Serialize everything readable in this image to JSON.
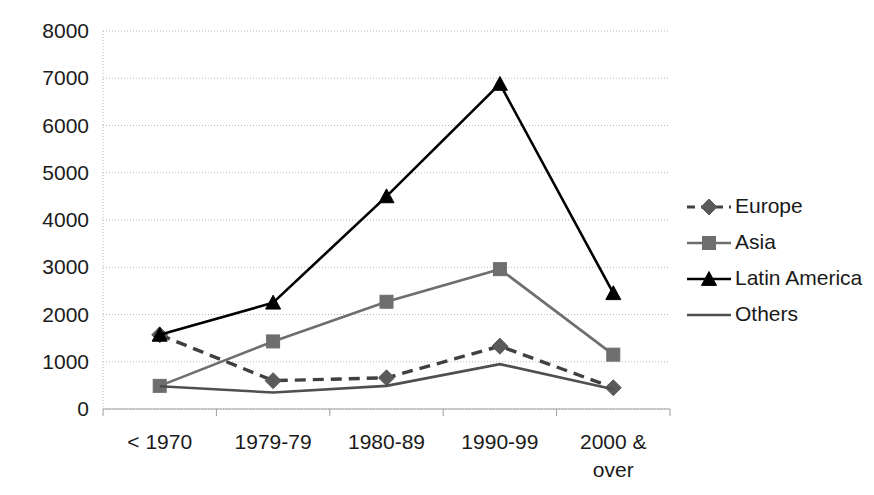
{
  "chart_data": {
    "type": "line",
    "title": "",
    "xlabel": "",
    "ylabel": "",
    "categories": [
      "< 1970",
      "1979-79",
      "1980-89",
      "1990-99",
      "2000 & over"
    ],
    "ylim": [
      0,
      8000
    ],
    "ytick_labels": [
      "0",
      "1000",
      "2000",
      "3000",
      "4000",
      "5000",
      "6000",
      "7000",
      "8000"
    ],
    "ytick_values": [
      0,
      1000,
      2000,
      3000,
      4000,
      5000,
      6000,
      7000,
      8000
    ],
    "grid": true,
    "legend_position": "right",
    "series": [
      {
        "name": "Europe",
        "values": [
          1570,
          600,
          660,
          1330,
          450
        ],
        "color": "#404040",
        "line_style": "dashed",
        "marker": "diamond",
        "marker_color": "#5a5a5a"
      },
      {
        "name": "Asia",
        "values": [
          490,
          1430,
          2270,
          2960,
          1150
        ],
        "color": "#6e6e6e",
        "line_style": "solid",
        "marker": "square",
        "marker_color": "#6e6e6e"
      },
      {
        "name": "Latin America",
        "values": [
          1570,
          2250,
          4500,
          6880,
          2450
        ],
        "color": "#000000",
        "line_style": "solid",
        "marker": "triangle",
        "marker_color": "#000000"
      },
      {
        "name": "Others",
        "values": [
          480,
          350,
          490,
          950,
          420
        ],
        "color": "#4f4f4f",
        "line_style": "solid",
        "marker": "none",
        "marker_color": "#4f4f4f"
      }
    ]
  },
  "axis": {
    "gridline_color": "#b9b9b9",
    "axis_color": "#9d9d9d"
  }
}
